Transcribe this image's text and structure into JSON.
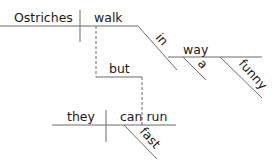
{
  "diagram": {
    "type": "sentence-diagram",
    "main_clause": {
      "subject": "Ostriches",
      "verb": "walk",
      "modifiers": {
        "preposition": "in",
        "object": "way",
        "object_modifiers": [
          "a",
          "funny"
        ]
      }
    },
    "conjunction": "but",
    "second_clause": {
      "subject": "they",
      "verb": "can run",
      "modifiers": [
        "fast"
      ]
    }
  }
}
